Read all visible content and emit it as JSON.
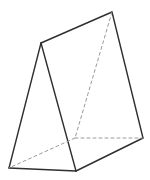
{
  "figure": {
    "kind": "triangular-prism-wireframe",
    "canvas": {
      "width": 150,
      "height": 180,
      "background": "#ffffff"
    },
    "style": {
      "solid_color": "#2f2f2f",
      "solid_width": 1.4,
      "dashed_color": "#9a9a9a",
      "dashed_width": 1,
      "dash_pattern": "3 3"
    },
    "vertices": {
      "front_top_apex": [
        41,
        43
      ],
      "back_top_apex": [
        112,
        12
      ],
      "front_bottom_left": [
        9,
        168
      ],
      "front_bottom_right": [
        76,
        171
      ],
      "back_bottom_right": [
        143,
        138
      ],
      "back_bottom_hidden": [
        75,
        138
      ]
    },
    "edges": [
      {
        "from": "front_top_apex",
        "to": "back_top_apex",
        "style": "solid"
      },
      {
        "from": "front_top_apex",
        "to": "front_bottom_left",
        "style": "solid"
      },
      {
        "from": "front_top_apex",
        "to": "front_bottom_right",
        "style": "solid"
      },
      {
        "from": "front_bottom_left",
        "to": "front_bottom_right",
        "style": "solid"
      },
      {
        "from": "front_bottom_right",
        "to": "back_bottom_right",
        "style": "solid"
      },
      {
        "from": "back_top_apex",
        "to": "back_bottom_right",
        "style": "solid"
      },
      {
        "from": "back_top_apex",
        "to": "back_bottom_hidden",
        "style": "dashed"
      },
      {
        "from": "back_bottom_hidden",
        "to": "back_bottom_right",
        "style": "dashed"
      },
      {
        "from": "back_bottom_hidden",
        "to": "front_bottom_left",
        "style": "dashed"
      }
    ]
  }
}
